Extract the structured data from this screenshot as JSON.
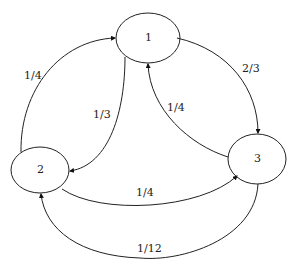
{
  "diagram": {
    "type": "state-transition-graph",
    "nodes": [
      {
        "id": "1",
        "label": "1"
      },
      {
        "id": "2",
        "label": "2"
      },
      {
        "id": "3",
        "label": "3"
      }
    ],
    "edges": [
      {
        "from": "1",
        "to": "3",
        "label": "2/3"
      },
      {
        "from": "3",
        "to": "1",
        "label": "1/4"
      },
      {
        "from": "2",
        "to": "1",
        "label": "1/4"
      },
      {
        "from": "1",
        "to": "2",
        "label": "1/3"
      },
      {
        "from": "2",
        "to": "3",
        "label": "1/4"
      },
      {
        "from": "3",
        "to": "2",
        "label": "1/12"
      }
    ]
  }
}
